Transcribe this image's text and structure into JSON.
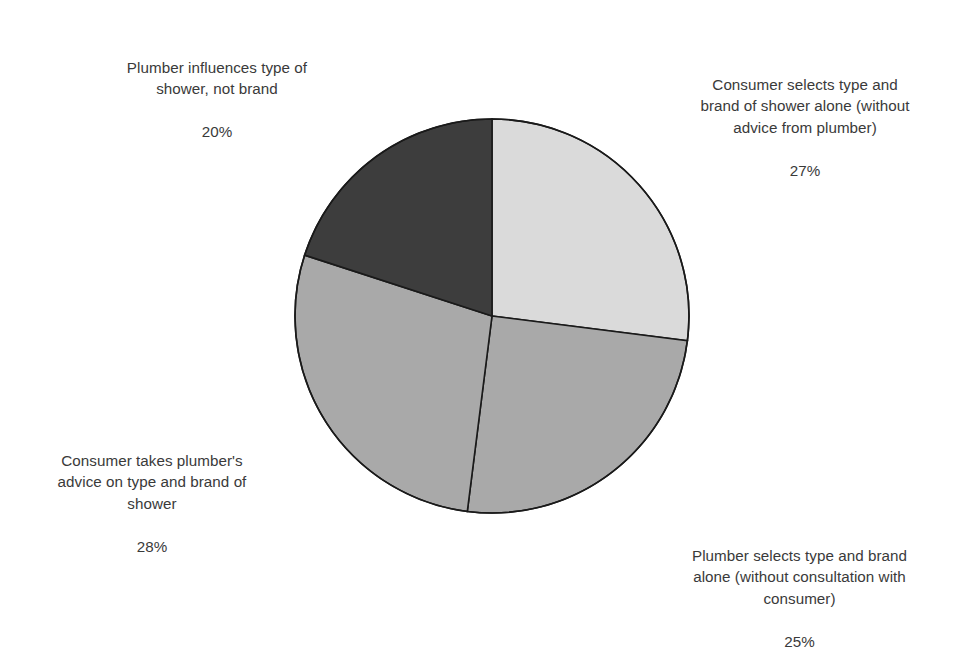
{
  "chart_data": {
    "type": "pie",
    "title": "",
    "subtitle": "",
    "xlabel": "",
    "ylabel": "",
    "grid": false,
    "legend_position": "none",
    "label_style": "outside-callout-text",
    "units": "percent",
    "total": 100,
    "start_angle_deg": 0,
    "direction": "clockwise",
    "categories": [
      "Consumer selects type and brand of shower alone (without advice from plumber)",
      "Plumber selects type and brand alone (without consultation with consumer)",
      "Consumer takes plumber's advice on type and brand of shower",
      "Plumber influences type of shower, not brand"
    ],
    "values": [
      27,
      25,
      28,
      20
    ],
    "value_labels": [
      "27%",
      "25%",
      "28%",
      "20%"
    ],
    "slice_colors": [
      "#dadada",
      "#a9a9a9",
      "#a9a9a9",
      "#3d3d3d"
    ],
    "slices": [
      {
        "label": "Consumer selects type and brand of shower alone (without advice from plumber)",
        "value": 27,
        "value_label": "27%",
        "color": "#dadada",
        "start_deg": 0,
        "end_deg": 97.2
      },
      {
        "label": "Plumber selects type and brand alone (without consultation with consumer)",
        "value": 25,
        "value_label": "25%",
        "color": "#a9a9a9",
        "start_deg": 97.2,
        "end_deg": 187.2
      },
      {
        "label": "Consumer takes plumber's advice on type and brand of shower",
        "value": 28,
        "value_label": "28%",
        "color": "#a9a9a9",
        "start_deg": 187.2,
        "end_deg": 288.0
      },
      {
        "label": "Plumber influences type of shower, not brand",
        "value": 20,
        "value_label": "20%",
        "color": "#3d3d3d",
        "start_deg": 288.0,
        "end_deg": 360.0
      }
    ]
  },
  "labels": {
    "top_left": {
      "text": "Plumber influences type of\nshower, not brand",
      "value": "20%"
    },
    "top_right": {
      "text": "Consumer selects type and\nbrand of shower alone (without\nadvice from plumber)",
      "value": "27%"
    },
    "bottom_left": {
      "text": "Consumer takes plumber's\nadvice on type and brand of\nshower",
      "value": "28%"
    },
    "bottom_right": {
      "text": "Plumber selects type and brand\nalone (without consultation with\nconsumer)",
      "value": "25%"
    }
  },
  "style": {
    "background": "#ffffff",
    "outline": "#1a1a1a",
    "text_color": "#3a3a3a"
  }
}
